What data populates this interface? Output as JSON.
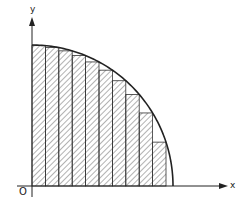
{
  "diagram": {
    "title": "",
    "labels": {
      "y_axis": "y",
      "x_axis": "x",
      "origin": "O"
    },
    "colors": {
      "line": "#222222",
      "hatch": "#444444",
      "background": "#ffffff"
    },
    "geometry": {
      "origin_px": [
        32,
        186
      ],
      "curve_radius_x_px": 141,
      "curve_radius_y_px": 141,
      "curve_type": "quarter-circle",
      "num_rectangles": 10,
      "rectangle_width_px": 13.4,
      "rectangle_height_rule": "inscribed (height at right edge)"
    }
  }
}
